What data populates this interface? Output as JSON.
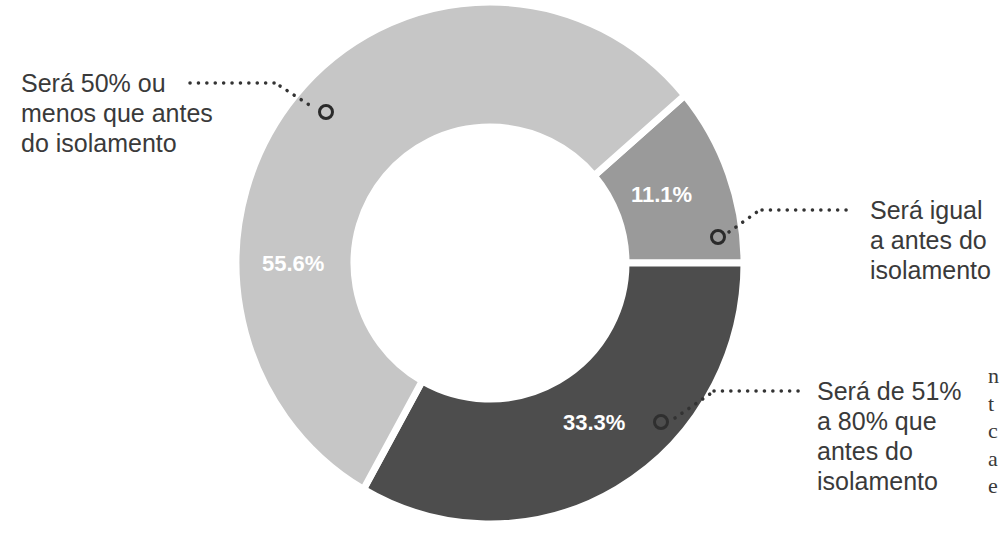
{
  "chart_data": {
    "type": "pie",
    "subtype": "donut",
    "title": "",
    "categories": [
      "Será igual a antes do isolamento",
      "Será de 51% a 80% que antes do isolamento",
      "Será 50% ou menos que antes do isolamento"
    ],
    "values": [
      11.1,
      33.3,
      55.6
    ],
    "value_labels": [
      "11.1%",
      "33.3%",
      "55.6%"
    ],
    "colors": [
      "#9a9a9a",
      "#4d4d4d",
      "#c6c6c6"
    ],
    "legend_position": "callouts"
  },
  "labels": {
    "light": "Será 50% ou\nmenos que antes\ndo isolamento",
    "mid": "Será igual\na antes do\nisolamento",
    "dark": "Será de 51%\na 80% que\nantes do\nisolamento"
  },
  "pcts": {
    "light": "55.6%",
    "mid": "11.1%",
    "dark": "33.3%"
  },
  "margin_fragment": "n\nt\nc\na\ne"
}
